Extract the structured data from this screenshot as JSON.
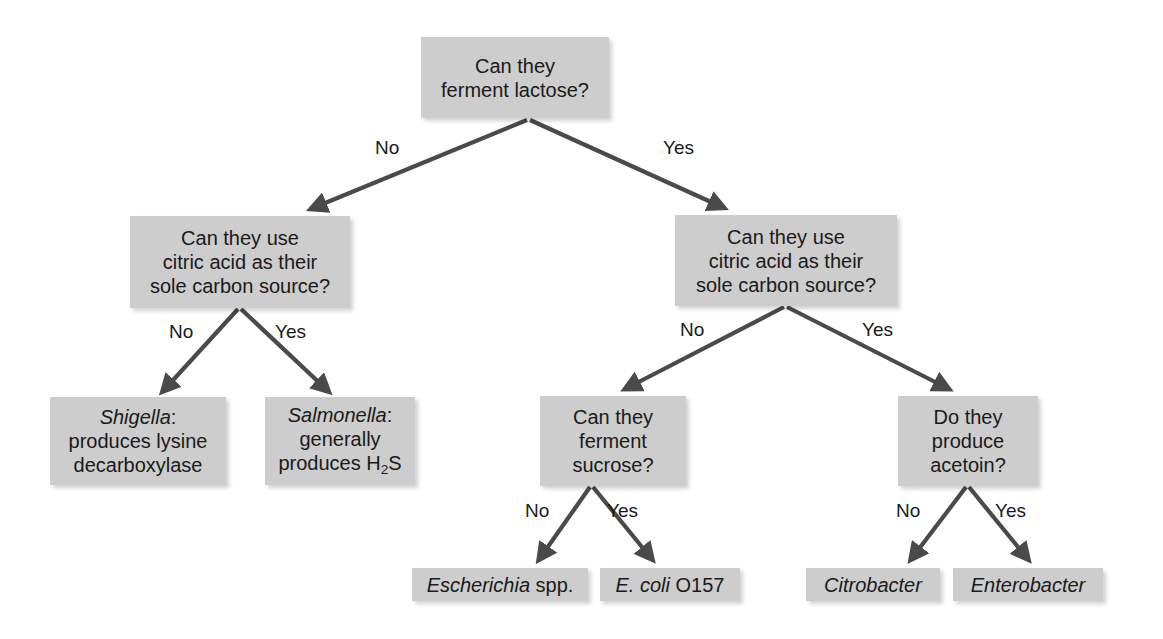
{
  "diagram": {
    "box_color": "#cdcdcd",
    "arrow_color": "#4a4a4a",
    "text_color": "#1a1a1a"
  },
  "nodes": {
    "root": {
      "line1": "Can they",
      "line2": "ferment lactose?"
    },
    "left_citrate": {
      "line1": "Can they use",
      "line2": "citric acid as their",
      "line3": "sole carbon source?"
    },
    "right_citrate": {
      "line1": "Can they use",
      "line2": "citric acid as their",
      "line3": "sole carbon source?"
    },
    "shigella": {
      "genus": "Shigella",
      "colon": ":",
      "line2": "produces lysine",
      "line3": "decarboxylase"
    },
    "salmonella": {
      "genus": "Salmonella",
      "colon": ":",
      "line2": "generally",
      "line3_pre": "produces H",
      "line3_sub": "2",
      "line3_post": "S"
    },
    "sucrose": {
      "line1": "Can they",
      "line2": "ferment",
      "line3": "sucrose?"
    },
    "acetoin": {
      "line1": "Do they",
      "line2": "produce",
      "line3": "acetoin?"
    },
    "escherichia": {
      "genus": "Escherichia",
      "suffix": " spp."
    },
    "ecoli": {
      "genus": "E. coli",
      "suffix": " O157"
    },
    "citrobacter": {
      "genus": "Citrobacter"
    },
    "enterobacter": {
      "genus": "Enterobacter"
    }
  },
  "edge_labels": {
    "root_no": "No",
    "root_yes": "Yes",
    "left_no": "No",
    "left_yes": "Yes",
    "right_no": "No",
    "right_yes": "Yes",
    "sucrose_no": "No",
    "sucrose_yes": "Yes",
    "acetoin_no": "No",
    "acetoin_yes": "Yes"
  }
}
